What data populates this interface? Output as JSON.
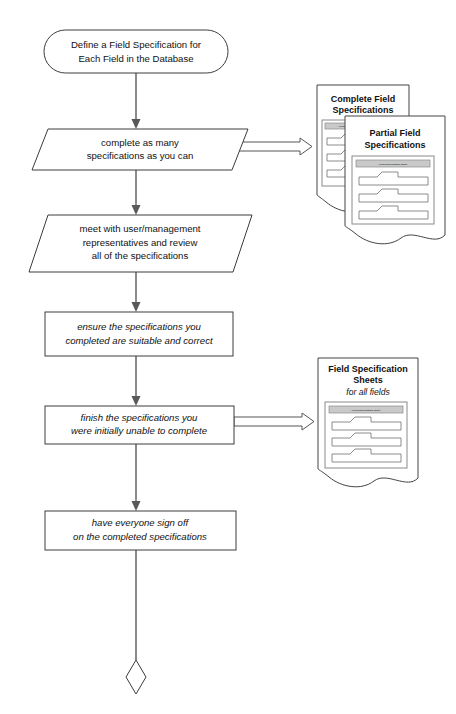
{
  "diagram": {
    "background_color": "#ffffff",
    "line_color": "#3c3c3c",
    "text_color": "#111111",
    "accent_band_color": "#c9c9c9"
  },
  "nodes": {
    "start": {
      "shape": "rounded-terminator",
      "line1": "Define a Field Specification for",
      "line2": "Each Field in the Database"
    },
    "step1": {
      "shape": "parallelogram",
      "line1": "complete as many",
      "line2": "specifications as you can"
    },
    "step2": {
      "shape": "parallelogram",
      "line1": "meet with user/management",
      "line2": "representatives and review",
      "line3": "all of the specifications"
    },
    "step3": {
      "shape": "rectangle",
      "style": "italic",
      "line1": "ensure the specifications you",
      "line2": "completed are suitable and correct"
    },
    "step4": {
      "shape": "rectangle",
      "style": "italic",
      "line1": "finish the specifications you",
      "line2": "were initially unable to complete"
    },
    "step5": {
      "shape": "rectangle",
      "style": "italic",
      "line1": "have everyone sign off",
      "line2": "on the completed specifications"
    },
    "end": {
      "shape": "diamond-connector",
      "label": ""
    }
  },
  "documents": {
    "complete_field_specs": {
      "line1": "Complete Field",
      "line2": "Specifications",
      "micro_header": "Field Specification Sheet"
    },
    "partial_field_specs": {
      "line1": "Partial Field",
      "line2": "Specifications",
      "micro_header": "Field Specification Sheet"
    },
    "field_spec_sheets": {
      "line1": "Field Specification",
      "line2": "Sheets",
      "subtitle": "for all fields",
      "micro_header": "Field Specification Sheet"
    }
  },
  "connectors": {
    "start_to_step1": "arrow-down",
    "step1_to_step2": "arrow-down",
    "step2_to_step3": "arrow-down",
    "step3_to_step4": "arrow-down",
    "step4_to_step5": "arrow-down",
    "step5_to_end": "line-down",
    "step1_to_docs": "block-arrow-right",
    "step4_to_docs": "block-arrow-right"
  }
}
